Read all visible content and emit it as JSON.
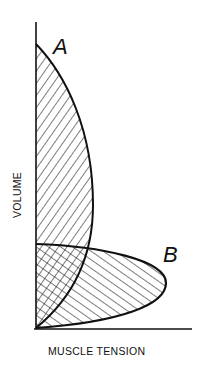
{
  "diagram": {
    "axes": {
      "x_label": "MUSCLE TENSION",
      "y_label": "VOLUME"
    },
    "curves": [
      {
        "id": "A",
        "label": "A",
        "hatch": "diagonal-right"
      },
      {
        "id": "B",
        "label": "B",
        "hatch": "diagonal-left"
      }
    ],
    "colors": {
      "stroke": "#111111",
      "background": "#ffffff"
    }
  }
}
